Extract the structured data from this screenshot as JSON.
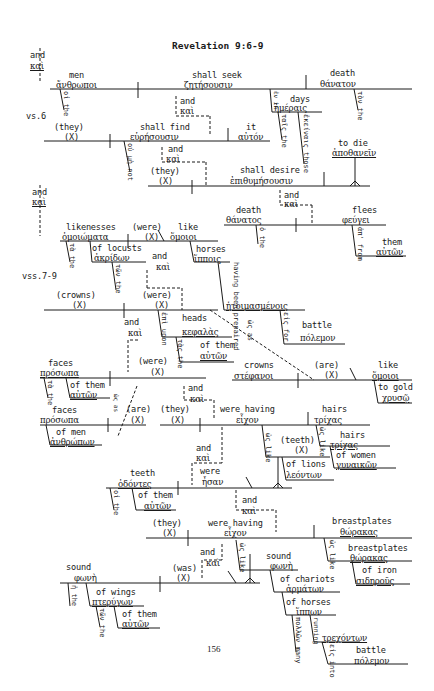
{
  "page": {
    "title": "Revelation 9:6-9",
    "page_number": "156",
    "verse_labels": {
      "vs6": "vs.6",
      "vss7_9": "vss.7-9"
    }
  },
  "vs6": {
    "conj_top": {
      "en": "and",
      "gr": "καὶ"
    },
    "clause1": {
      "subject": {
        "en": "men",
        "gr": "ἄνθρωποι",
        "article": "οἱ the"
      },
      "verb": {
        "en": "shall seek",
        "gr": "ζητήσουσιν"
      },
      "object": {
        "en": "death",
        "gr": "θάνατον",
        "article": "τὸν the"
      },
      "prep_phrase": {
        "prep": "ἐν in",
        "obj_en": "days",
        "obj_gr": "ἡμέραις",
        "article": "ταῖς the",
        "modifier": "ἐκείναις those"
      }
    },
    "conj1": {
      "en": "and",
      "gr": "καὶ"
    },
    "clause2": {
      "subject": {
        "en": "(they)",
        "gr": "(X)"
      },
      "verb": {
        "en": "shall find",
        "gr": "εὑρήσουσιν"
      },
      "negation": "οὐ μὴ not",
      "object": {
        "en": "it",
        "gr": "αὐτόν"
      }
    },
    "conj2": {
      "en": "and",
      "gr": "καὶ"
    },
    "clause3": {
      "subject": {
        "en": "(they)",
        "gr": "(X)"
      },
      "verb": {
        "en": "shall desire",
        "gr": "ἐπιθυμήσουσιν"
      },
      "object": {
        "en": "to die",
        "gr": "ἀποθανεῖν"
      }
    },
    "conj3": {
      "en": "and",
      "gr": "καὶ"
    },
    "clause4": {
      "subject": {
        "en": "death",
        "gr": "θάνατος",
        "article": "ὁ the"
      },
      "verb": {
        "en": "flees",
        "gr": "φεύγει"
      },
      "prep_phrase": {
        "prep": "ἀπ' from",
        "obj_en": "them",
        "obj_gr": "αὐτῶν"
      }
    }
  },
  "vss7_9": {
    "conj_top": {
      "en": "and",
      "gr": "καὶ"
    },
    "clause1": {
      "subject": {
        "en": "likenesses",
        "gr": "ὁμοιώματα",
        "article": "τὰ the"
      },
      "genitive": {
        "en": "of locusts",
        "gr": "ἀκρίδων",
        "article": "τῶν the"
      },
      "verb": {
        "en": "(were)",
        "gr": "(X)"
      },
      "predicate": {
        "en": "like",
        "gr": "ὅμοιοι"
      },
      "object": {
        "en": "horses",
        "gr": "ἵπποις"
      },
      "participle": {
        "en": "having been prepaired",
        "gr": "ἡτοιμασμένοις"
      },
      "prep_phrase": {
        "prep": "εἰς for",
        "obj_en": "battle",
        "obj_gr": "πόλεμον"
      }
    },
    "conj1": {
      "en": "and",
      "gr": "καὶ"
    },
    "clause2": {
      "subject": {
        "en": "(crowns)",
        "gr": "(X)"
      },
      "verb": {
        "en": "(were)",
        "gr": "(X)"
      },
      "prep_phrase": {
        "prep": "ἐπὶ upon",
        "obj_en": "heads",
        "obj_gr": "κεφαλὰς",
        "article": "τὰς the",
        "genitive": {
          "en": "of them",
          "gr": "αὐτῶν"
        }
      },
      "comparison": "ὡς as",
      "subject2": {
        "en": "crowns",
        "gr": "στέφανοι"
      },
      "verb2": {
        "en": "(are)",
        "gr": "(X)"
      },
      "predicate": {
        "en": "like",
        "gr": "ὅμοιοι"
      },
      "dative": {
        "en": "to gold",
        "gr": "χρυσῷ"
      }
    },
    "clause3": {
      "subject": {
        "en": "faces",
        "gr": "πρόσωπα",
        "article": "τὰ the",
        "genitive": {
          "en": "of them",
          "gr": "αὐτῶν"
        }
      },
      "verb": {
        "en": "(were)",
        "gr": "(X)"
      },
      "comparison": "ὡς as",
      "subject2": {
        "en": "faces",
        "gr": "πρόσωπα",
        "genitive": {
          "en": "of men",
          "gr": "ἀνθρώπων"
        }
      },
      "verb2": {
        "en": "(are)",
        "gr": "(X)"
      }
    },
    "conj2": {
      "en": "and",
      "gr": "καὶ"
    },
    "clause4": {
      "subject": {
        "en": "(they)",
        "gr": "(X)"
      },
      "verb": {
        "en": "were having",
        "gr": "εἶχον"
      },
      "object": {
        "en": "hairs",
        "gr": "τρίχας"
      },
      "comparison": {
        "word": "ὡς like",
        "en": "hairs",
        "gr": "τρίχας",
        "genitive": {
          "en": "of women",
          "gr": "γυναικῶν"
        }
      }
    },
    "conj3": {
      "en": "and",
      "gr": "καὶ"
    },
    "clause5": {
      "subject": {
        "en": "teeth",
        "gr": "ὀδόντες",
        "article": "οἱ the",
        "genitive": {
          "en": "of them",
          "gr": "αὐτῶν"
        }
      },
      "verb": {
        "en": "were",
        "gr": "ἦσαν"
      },
      "comparison": {
        "word": "ὡς like",
        "en": "(teeth)",
        "gr": "(X)",
        "genitive": {
          "en": "of lions",
          "gr": "λεόντων"
        }
      }
    },
    "conj4": {
      "en": "and",
      "gr": "καὶ"
    },
    "clause6": {
      "subject": {
        "en": "(they)",
        "gr": "(X)"
      },
      "verb": {
        "en": "were having",
        "gr": "εἶχον"
      },
      "object": {
        "en": "breastplates",
        "gr": "θώρακας"
      },
      "comparison": {
        "word": "ὡς like",
        "en": "breastplates",
        "gr": "θώρακας",
        "modifier": {
          "en": "of iron",
          "gr": "σιδηροῦς"
        }
      }
    },
    "conj5": {
      "en": "and",
      "gr": "καὶ"
    },
    "clause7": {
      "subject": {
        "en": "sound",
        "gr": "φωνὴ",
        "article": "ἡ the",
        "genitive": {
          "en": "of wings",
          "gr": "πτερύγων",
          "article": "τῶν the",
          "genitive": {
            "en": "of them",
            "gr": "αὐτῶν"
          }
        }
      },
      "verb": {
        "en": "(was)",
        "gr": "(X)"
      },
      "comparison": {
        "word": "ὡς like",
        "en": "sound",
        "gr": "φωνὴ",
        "genitive": {
          "en": "of chariots",
          "gr": "ἁρμάτων"
        },
        "genitive2": {
          "en": "of horses",
          "gr": "ἵππων",
          "modifier": "πολλῶν many"
        },
        "participle": {
          "en": "running",
          "gr": "τρεχόντων",
          "prep_phrase": {
            "prep": "εἰς into",
            "obj_en": "battle",
            "obj_gr": "πόλεμον"
          }
        }
      }
    }
  }
}
